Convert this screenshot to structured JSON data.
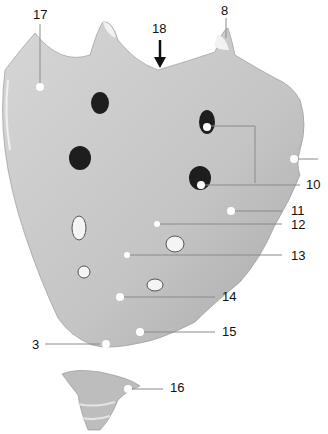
{
  "figure": {
    "colors": {
      "bone": "#c9c9c9",
      "bone_dark": "#a8a8a8",
      "foramen": "#1e1e1e",
      "line": "#9a9a9a",
      "dot": "#ffffff"
    }
  },
  "labels": [
    {
      "id": "17",
      "text": "17",
      "x": 33,
      "y": 8
    },
    {
      "id": "18",
      "text": "18",
      "x": 152,
      "y": 22
    },
    {
      "id": "8",
      "text": "8",
      "x": 220,
      "y": 5
    },
    {
      "id": "10",
      "text": "10",
      "x": 306,
      "y": 178
    },
    {
      "id": "11",
      "text": "11",
      "x": 291,
      "y": 204
    },
    {
      "id": "12",
      "text": "12",
      "x": 291,
      "y": 219
    },
    {
      "id": "13",
      "text": "13",
      "x": 291,
      "y": 250
    },
    {
      "id": "14",
      "text": "14",
      "x": 222,
      "y": 290
    },
    {
      "id": "15",
      "text": "15",
      "x": 222,
      "y": 325
    },
    {
      "id": "3",
      "text": "3",
      "x": 32,
      "y": 339
    },
    {
      "id": "16",
      "text": "16",
      "x": 170,
      "y": 381
    }
  ]
}
